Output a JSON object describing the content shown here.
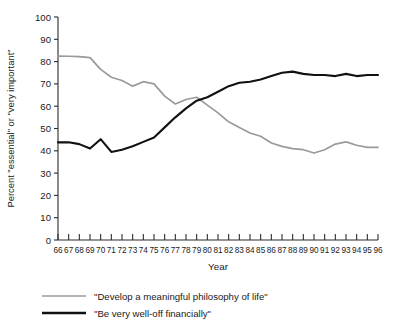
{
  "chart_data": {
    "type": "line",
    "title": "",
    "xlabel": "Year",
    "ylabel": "Percent \"essential\" or \"very important\"",
    "xlim": [
      66,
      96
    ],
    "ylim": [
      0,
      100
    ],
    "ytick_step": 10,
    "grid": false,
    "legend_position": "bottom-left",
    "categories": [
      "66",
      "67",
      "68",
      "69",
      "70",
      "71",
      "72",
      "73",
      "74",
      "75",
      "76",
      "77",
      "78",
      "79",
      "80",
      "81",
      "82",
      "83",
      "84",
      "85",
      "86",
      "87",
      "88",
      "89",
      "90",
      "91",
      "92",
      "93",
      "94",
      "95",
      "96"
    ],
    "yticks": [
      "0",
      "10",
      "20",
      "30",
      "40",
      "50",
      "60",
      "70",
      "80",
      "90",
      "100"
    ],
    "series": [
      {
        "name": "\"Develop a meaningful philosophy of life\"",
        "color": "#9a9a9a",
        "values": [
          82.5,
          82.4,
          82.2,
          81.8,
          76.5,
          73.0,
          71.5,
          69.0,
          71.0,
          70.0,
          64.5,
          61.0,
          63.0,
          64.0,
          60.5,
          57.0,
          53.0,
          50.5,
          48.0,
          46.5,
          43.5,
          42.0,
          41.0,
          40.5,
          39.0,
          40.5,
          43.0,
          44.0,
          42.5,
          41.5,
          41.5
        ]
      },
      {
        "name": "\"Be very well-off financially\"",
        "color": "#111111",
        "values": [
          43.8,
          43.8,
          43.0,
          41.0,
          45.2,
          39.5,
          40.5,
          42.0,
          44.0,
          46.0,
          50.5,
          55.0,
          59.0,
          62.5,
          64.0,
          66.5,
          69.0,
          70.5,
          71.0,
          72.0,
          73.5,
          75.0,
          75.5,
          74.5,
          74.0,
          74.0,
          73.5,
          74.5,
          73.5,
          74.0,
          74.0
        ]
      }
    ]
  },
  "legend": {
    "items": [
      {
        "label": "\"Develop a meaningful philosophy of life\"",
        "color": "#9a9a9a"
      },
      {
        "label": "\"Be very well-off financially\"",
        "color": "#111111"
      }
    ]
  }
}
